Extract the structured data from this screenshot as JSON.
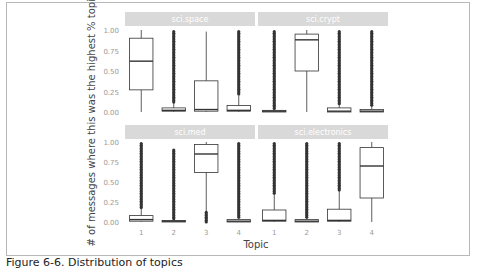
{
  "chart_data": {
    "type": "box",
    "title": "",
    "xlabel": "Topic",
    "ylabel": "# of messages where this was the highest % topic",
    "ylim": [
      0,
      1
    ],
    "yticks": [
      "0.00",
      "0.25",
      "0.50",
      "0.75",
      "1.00"
    ],
    "categories": [
      "1",
      "2",
      "3",
      "4"
    ],
    "grid": false,
    "facet_layout": "2x2",
    "panels": [
      {
        "name": "sci.space",
        "boxes": [
          {
            "topic": "1",
            "whisker_low": 0.0,
            "q1": 0.27,
            "median": 0.62,
            "q3": 0.9,
            "whisker_high": 1.0,
            "outliers": []
          },
          {
            "topic": "2",
            "whisker_low": 0.0,
            "q1": 0.01,
            "median": 0.02,
            "q3": 0.05,
            "whisker_high": 0.12,
            "outliers": {
              "from": 0.12,
              "to": 0.98
            }
          },
          {
            "topic": "3",
            "whisker_low": 0.0,
            "q1": 0.01,
            "median": 0.03,
            "q3": 0.38,
            "whisker_high": 0.98,
            "outliers": []
          },
          {
            "topic": "4",
            "whisker_low": 0.0,
            "q1": 0.01,
            "median": 0.02,
            "q3": 0.08,
            "whisker_high": 0.2,
            "outliers": {
              "from": 0.2,
              "to": 0.98
            }
          }
        ]
      },
      {
        "name": "sci.crypt",
        "boxes": [
          {
            "topic": "1",
            "whisker_low": 0.0,
            "q1": 0.0,
            "median": 0.01,
            "q3": 0.02,
            "whisker_high": 0.04,
            "outliers": {
              "from": 0.04,
              "to": 0.98
            }
          },
          {
            "topic": "2",
            "whisker_low": 0.0,
            "q1": 0.5,
            "median": 0.88,
            "q3": 0.95,
            "whisker_high": 1.0,
            "outliers": []
          },
          {
            "topic": "3",
            "whisker_low": 0.0,
            "q1": 0.0,
            "median": 0.01,
            "q3": 0.05,
            "whisker_high": 0.1,
            "outliers": {
              "from": 0.1,
              "to": 0.98
            }
          },
          {
            "topic": "4",
            "whisker_low": 0.0,
            "q1": 0.0,
            "median": 0.01,
            "q3": 0.03,
            "whisker_high": 0.07,
            "outliers": {
              "from": 0.07,
              "to": 0.98
            }
          }
        ]
      },
      {
        "name": "sci.med",
        "boxes": [
          {
            "topic": "1",
            "whisker_low": 0.0,
            "q1": 0.01,
            "median": 0.03,
            "q3": 0.08,
            "whisker_high": 0.18,
            "outliers": {
              "from": 0.18,
              "to": 0.98
            }
          },
          {
            "topic": "2",
            "whisker_low": 0.0,
            "q1": 0.0,
            "median": 0.01,
            "q3": 0.02,
            "whisker_high": 0.04,
            "outliers": {
              "from": 0.04,
              "to": 0.9
            }
          },
          {
            "topic": "3",
            "whisker_low": 0.12,
            "q1": 0.62,
            "median": 0.85,
            "q3": 0.97,
            "whisker_high": 1.0,
            "outliers": {
              "from": 0.0,
              "to": 0.12
            }
          },
          {
            "topic": "4",
            "whisker_low": 0.0,
            "q1": 0.0,
            "median": 0.01,
            "q3": 0.03,
            "whisker_high": 0.06,
            "outliers": {
              "from": 0.06,
              "to": 0.98
            }
          }
        ]
      },
      {
        "name": "sci.electronics",
        "boxes": [
          {
            "topic": "1",
            "whisker_low": 0.0,
            "q1": 0.01,
            "median": 0.02,
            "q3": 0.15,
            "whisker_high": 0.35,
            "outliers": {
              "from": 0.35,
              "to": 0.98
            }
          },
          {
            "topic": "2",
            "whisker_low": 0.0,
            "q1": 0.0,
            "median": 0.01,
            "q3": 0.03,
            "whisker_high": 0.06,
            "outliers": {
              "from": 0.06,
              "to": 0.98
            }
          },
          {
            "topic": "3",
            "whisker_low": 0.0,
            "q1": 0.01,
            "median": 0.02,
            "q3": 0.16,
            "whisker_high": 0.4,
            "outliers": {
              "from": 0.4,
              "to": 0.98
            }
          },
          {
            "topic": "4",
            "whisker_low": 0.0,
            "q1": 0.3,
            "median": 0.7,
            "q3": 0.93,
            "whisker_high": 1.0,
            "outliers": []
          }
        ]
      }
    ]
  },
  "caption": "Figure 6-6. Distribution of topics",
  "colors": {
    "strip_bg": "#d9d9d9",
    "strip_text": "#ffffff",
    "box_stroke": "#333333",
    "outlier": "#333333",
    "tick_text": "#9a9a9a",
    "axis_title": "#444444"
  }
}
